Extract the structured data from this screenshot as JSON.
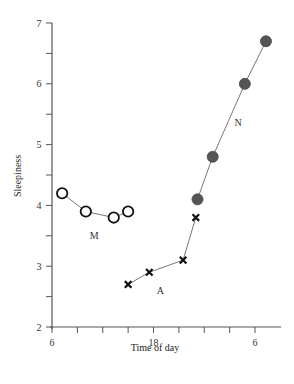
{
  "chart_data": {
    "type": "line",
    "title": "",
    "xlabel": "Time of day",
    "ylabel": "Sleepiness",
    "xlim": [
      6,
      33.5
    ],
    "ylim": [
      2,
      7
    ],
    "x_ticks": [
      6,
      9,
      12,
      15,
      18,
      21,
      24,
      27,
      30
    ],
    "x_tick_labels": [
      {
        "value": 6,
        "label": "6"
      },
      {
        "value": 18,
        "label": "18"
      },
      {
        "value": 30,
        "label": "6"
      }
    ],
    "y_ticks": [
      2,
      2.5,
      3,
      3.5,
      4,
      4.5,
      5,
      5.5,
      6,
      6.5,
      7
    ],
    "y_tick_labels": [
      {
        "value": 2,
        "label": "2"
      },
      {
        "value": 3,
        "label": "3"
      },
      {
        "value": 4,
        "label": "4"
      },
      {
        "value": 5,
        "label": "5"
      },
      {
        "value": 6,
        "label": "6"
      },
      {
        "value": 7,
        "label": "7"
      }
    ],
    "grid": false,
    "legend": "none (series labeled inline)",
    "series": [
      {
        "name": "M",
        "marker": "open-circle",
        "x": [
          7.2,
          10.0,
          13.3,
          15.0
        ],
        "values": [
          4.2,
          3.9,
          3.8,
          3.9
        ],
        "label_pos": [
          11.0,
          3.45
        ]
      },
      {
        "name": "A",
        "marker": "cross",
        "x": [
          15.0,
          17.5,
          21.5,
          23.0
        ],
        "values": [
          2.7,
          2.9,
          3.1,
          3.8
        ],
        "label_pos": [
          18.8,
          2.55
        ]
      },
      {
        "name": "N",
        "marker": "filled-circle",
        "x": [
          23.2,
          25.0,
          28.8,
          31.3
        ],
        "values": [
          4.1,
          4.8,
          6.0,
          6.7
        ],
        "label_pos": [
          28.0,
          5.3
        ]
      }
    ]
  },
  "labels": {
    "xlabel": "Time of day",
    "ylabel": "Sleepiness",
    "series_m": "M",
    "series_a": "A",
    "series_n": "N"
  },
  "colors": {
    "axis": "#555555",
    "line": "#777777",
    "filled_marker": "#555555",
    "cross_marker": "#111111",
    "open_marker_stroke": "#111111"
  }
}
